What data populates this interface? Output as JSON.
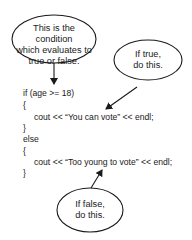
{
  "callouts": {
    "condition": {
      "lines": [
        "This is the condition",
        "which evaluates to",
        "true or false."
      ]
    },
    "if_true": {
      "lines": [
        "If true,",
        "do this."
      ]
    },
    "if_false": {
      "lines": [
        "If false,",
        "do this."
      ]
    }
  },
  "code": {
    "lines": [
      "if (age >= 18)",
      "{",
      "cout << “You can vote” << endl;",
      "}",
      "else",
      "{",
      "cout << “Too young to vote” << endl;",
      "}"
    ]
  },
  "colors": {
    "stroke": "#1a1a1a",
    "background": "#ffffff"
  }
}
